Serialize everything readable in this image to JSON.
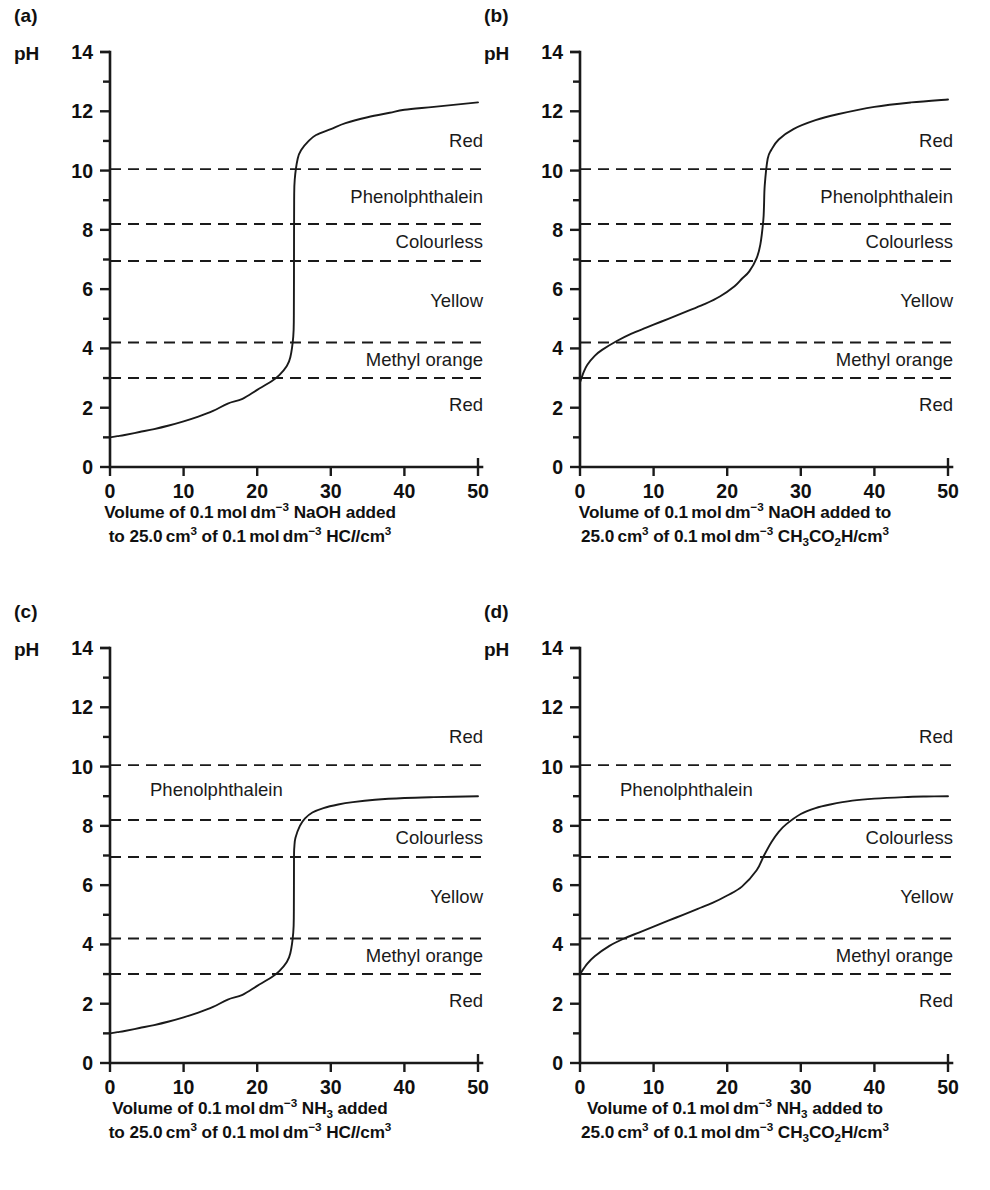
{
  "figure": {
    "panel_count": 4,
    "y_axis_name": "pH",
    "axis": {
      "y_ticks": [
        0,
        2,
        4,
        6,
        8,
        10,
        12,
        14
      ],
      "x_ticks": [
        0,
        10,
        20,
        30,
        40,
        50
      ],
      "ylim": [
        0,
        14
      ],
      "xlim": [
        0,
        50
      ],
      "y_minor_step": 1
    },
    "indicator_lines": [
      3.0,
      4.2,
      6.95,
      8.2,
      10.05
    ],
    "zone_labels": {
      "red_top": "Red",
      "phenolphthalein": "Phenolphthalein",
      "colourless": "Colourless",
      "yellow": "Yellow",
      "methyl_orange": "Methyl orange",
      "red_bottom": "Red"
    }
  },
  "panels": [
    {
      "letter": "(a)",
      "caption_line1": "Volume of 0.1 mol dm−3 NaOH added",
      "caption_line2": "to 25.0 cm3 of 0.1 mol dm−3 HCl/cm3",
      "caption_html_1": "Volume of 0.1&#8201;mol&#8201;dm<sup>&#8722;3</sup> NaOH added",
      "caption_html_2": "to 25.0&#8201;cm<sup>3</sup> of 0.1&#8201;mol&#8201;dm<sup>&#8722;3</sup> HC<span class=\"it\">l</span>/cm<sup>3</sup>",
      "titrant": "NaOH",
      "analyte": "HCl",
      "analyte_volume": "25.0 cm3",
      "concentration": "0.1 mol dm-3",
      "equivalence_volume": 25,
      "start_pH": 1.0,
      "end_pH": 12.3,
      "equivalence_pH": 7.0
    },
    {
      "letter": "(b)",
      "caption_line1": "Volume of 0.1 mol dm−3 NaOH added to",
      "caption_line2": "25.0 cm3 of 0.1 mol dm−3 CH3CO2H/cm3",
      "caption_html_1": "Volume of 0.1&#8201;mol&#8201;dm<sup>&#8722;3</sup> NaOH added to",
      "caption_html_2": "25.0&#8201;cm<sup>3</sup> of 0.1&#8201;mol&#8201;dm<sup>&#8722;3</sup> CH<sub>3</sub>CO<sub>2</sub>H/cm<sup>3</sup>",
      "titrant": "NaOH",
      "analyte": "CH3CO2H",
      "analyte_volume": "25.0 cm3",
      "concentration": "0.1 mol dm-3",
      "equivalence_volume": 25,
      "start_pH": 2.85,
      "end_pH": 12.4,
      "equivalence_pH": 8.8
    },
    {
      "letter": "(c)",
      "caption_line1": "Volume of 0.1 mol dm−3 NH3 added",
      "caption_line2": "to 25.0 cm3 of 0.1 mol dm−3 HCl/cm3",
      "caption_html_1": "Volume of 0.1&#8201;mol&#8201;dm<sup>&#8722;3</sup> NH<sub>3</sub> added",
      "caption_html_2": "to 25.0&#8201;cm<sup>3</sup> of 0.1&#8201;mol&#8201;dm<sup>&#8722;3</sup> HC<span class=\"it\">l</span>/cm<sup>3</sup>",
      "titrant": "NH3",
      "analyte": "HCl",
      "analyte_volume": "25.0 cm3",
      "concentration": "0.1 mol dm-3",
      "equivalence_volume": 25,
      "start_pH": 1.0,
      "end_pH": 9.0,
      "equivalence_pH": 5.3
    },
    {
      "letter": "(d)",
      "caption_line1": "Volume of 0.1 mol dm−3 NH3 added to",
      "caption_line2": "25.0 cm3 of 0.1 mol dm−3 CH3CO2H/cm3",
      "caption_html_1": "Volume of 0.1&#8201;mol&#8201;dm<sup>&#8722;3</sup> NH<sub>3</sub> added to",
      "caption_html_2": "25.0&#8201;cm<sup>3</sup> of 0.1&#8201;mol&#8201;dm<sup>&#8722;3</sup> CH<sub>3</sub>CO<sub>2</sub>H/cm<sup>3</sup>",
      "titrant": "NH3",
      "analyte": "CH3CO2H",
      "analyte_volume": "25.0 cm3",
      "concentration": "0.1 mol dm-3",
      "equivalence_volume": 25,
      "start_pH": 3.0,
      "end_pH": 9.0,
      "equivalence_pH": 7.0
    }
  ],
  "chart_data": [
    {
      "type": "line",
      "id": "a",
      "title": "(a) strong acid titrated with strong base",
      "xlabel": "Volume of 0.1 mol dm-3 NaOH added to 25.0 cm3 of 0.1 mol dm-3 HCl/cm3",
      "ylabel": "pH",
      "xlim": [
        0,
        50
      ],
      "ylim": [
        0,
        14
      ],
      "grid": false,
      "legend": "none",
      "x": [
        0,
        1,
        2,
        4,
        6,
        8,
        10,
        12,
        14,
        16,
        18,
        20,
        22,
        23,
        24,
        24.5,
        24.9,
        24.98,
        25,
        25.02,
        25.1,
        25.5,
        26,
        27,
        28,
        30,
        32,
        35,
        38,
        40,
        44,
        50
      ],
      "y": [
        1.0,
        1.04,
        1.08,
        1.18,
        1.28,
        1.4,
        1.54,
        1.7,
        1.89,
        2.14,
        2.3,
        2.6,
        2.9,
        3.1,
        3.4,
        3.7,
        4.4,
        5.1,
        7.0,
        9.0,
        9.7,
        10.4,
        10.7,
        11.0,
        11.2,
        11.4,
        11.6,
        11.8,
        11.95,
        12.05,
        12.15,
        12.3
      ],
      "annotations": [
        "Red",
        "Phenolphthalein",
        "Colourless",
        "Yellow",
        "Methyl orange",
        "Red"
      ],
      "hlines": [
        3.0,
        4.2,
        6.95,
        8.2,
        10.05
      ]
    },
    {
      "type": "line",
      "id": "b",
      "title": "(b) weak acid titrated with strong base",
      "xlabel": "Volume of 0.1 mol dm-3 NaOH added to 25.0 cm3 of 0.1 mol dm-3 CH3CO2H/cm3",
      "ylabel": "pH",
      "xlim": [
        0,
        50
      ],
      "ylim": [
        0,
        14
      ],
      "grid": false,
      "legend": "none",
      "x": [
        0,
        0.5,
        1,
        2,
        3,
        5,
        7,
        9,
        11,
        13,
        15,
        17,
        19,
        21,
        22,
        23,
        24,
        24.5,
        24.9,
        25,
        25.1,
        25.5,
        26,
        27,
        29,
        32,
        35,
        40,
        45,
        50
      ],
      "y": [
        2.85,
        3.2,
        3.45,
        3.75,
        3.95,
        4.25,
        4.5,
        4.7,
        4.9,
        5.1,
        5.3,
        5.5,
        5.75,
        6.1,
        6.35,
        6.6,
        7.05,
        7.5,
        8.3,
        8.8,
        9.5,
        10.4,
        10.7,
        11.05,
        11.4,
        11.7,
        11.9,
        12.15,
        12.3,
        12.4
      ],
      "annotations": [
        "Red",
        "Phenolphthalein",
        "Colourless",
        "Yellow",
        "Methyl orange",
        "Red"
      ],
      "hlines": [
        3.0,
        4.2,
        6.95,
        8.2,
        10.05
      ]
    },
    {
      "type": "line",
      "id": "c",
      "title": "(c) strong acid titrated with weak base",
      "xlabel": "Volume of 0.1 mol dm-3 NH3 added to 25.0 cm3 of 0.1 mol dm-3 HCl/cm3",
      "ylabel": "pH",
      "xlim": [
        0,
        50
      ],
      "ylim": [
        0,
        14
      ],
      "grid": false,
      "legend": "none",
      "x": [
        0,
        1,
        2,
        4,
        6,
        8,
        10,
        12,
        14,
        16,
        18,
        20,
        22,
        23,
        24,
        24.5,
        24.9,
        24.98,
        25,
        25.05,
        25.2,
        25.8,
        26.5,
        27.5,
        29,
        31,
        33,
        36,
        40,
        44,
        50
      ],
      "y": [
        1.0,
        1.04,
        1.08,
        1.18,
        1.28,
        1.4,
        1.54,
        1.7,
        1.89,
        2.14,
        2.3,
        2.6,
        2.9,
        3.1,
        3.4,
        3.7,
        4.4,
        5.1,
        6.9,
        7.3,
        7.6,
        8.0,
        8.25,
        8.45,
        8.6,
        8.72,
        8.8,
        8.88,
        8.94,
        8.97,
        9.0
      ],
      "annotations": [
        "Red",
        "Phenolphthalein",
        "Colourless",
        "Yellow",
        "Methyl orange",
        "Red"
      ],
      "hlines": [
        3.0,
        4.2,
        6.95,
        8.2,
        10.05
      ]
    },
    {
      "type": "line",
      "id": "d",
      "title": "(d) weak acid titrated with weak base",
      "xlabel": "Volume of 0.1 mol dm-3 NH3 added to 25.0 cm3 of 0.1 mol dm-3 CH3CO2H/cm3",
      "ylabel": "pH",
      "xlim": [
        0,
        50
      ],
      "ylim": [
        0,
        14
      ],
      "grid": false,
      "legend": "none",
      "x": [
        0,
        1,
        2,
        4,
        6,
        8,
        10,
        12,
        14,
        16,
        18,
        20,
        22,
        24,
        25,
        26,
        27,
        28,
        30,
        32,
        34,
        37,
        40,
        44,
        47,
        50
      ],
      "y": [
        3.0,
        3.35,
        3.6,
        3.95,
        4.2,
        4.4,
        4.6,
        4.8,
        5.0,
        5.2,
        5.4,
        5.65,
        5.95,
        6.5,
        7.0,
        7.45,
        7.8,
        8.05,
        8.4,
        8.6,
        8.72,
        8.85,
        8.92,
        8.97,
        8.99,
        9.0
      ],
      "annotations": [
        "Red",
        "Phenolphthalein",
        "Colourless",
        "Yellow",
        "Methyl orange",
        "Red"
      ],
      "hlines": [
        3.0,
        4.2,
        6.95,
        8.2,
        10.05
      ]
    }
  ]
}
